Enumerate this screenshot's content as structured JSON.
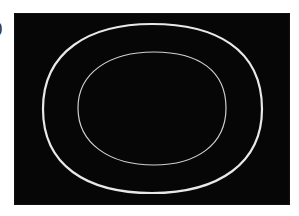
{
  "figure": {
    "panel_label": ")",
    "background_color": "#060606",
    "ring_color": "#e8e8e8",
    "rings": [
      {
        "name": "outer-ring",
        "cx": 138,
        "cy": 96,
        "rx": 109,
        "ry": 85,
        "stroke_width": 2.2
      },
      {
        "name": "inner-ring",
        "cx": 138,
        "cy": 96,
        "rx": 74,
        "ry": 57,
        "stroke_width": 1.2
      }
    ]
  }
}
